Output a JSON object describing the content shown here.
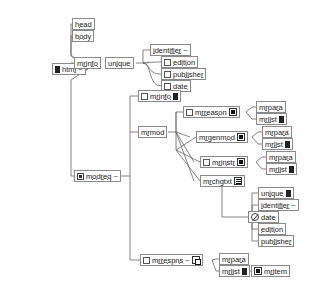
{
  "diagram": {
    "type": "content-model-tree",
    "colors": {
      "background": "#ffffff",
      "node_border": "#8a8a8a",
      "node_fill": "#ffffff",
      "wire": "#666666",
      "text": "#1a1a1a",
      "icon_fill": "#111111"
    },
    "icon_names": {
      "bar": "solid-bar-icon",
      "checkbox": "empty-checkbox-icon",
      "filled": "filled-square-icon",
      "stack": "stacked-lines-icon",
      "copy": "duplicate-box-icon",
      "mod": "module-icon",
      "ban": "circle-slash-icon"
    },
    "nodes": [
      {
        "id": "html",
        "label": "html",
        "tilde": "~",
        "left_icon": "bar",
        "right_icon": null,
        "x": 52,
        "y": 63
      },
      {
        "id": "head",
        "label": "head",
        "tilde": "",
        "left_icon": null,
        "right_icon": null,
        "x": 72,
        "y": 18
      },
      {
        "id": "body",
        "label": "body",
        "tilde": "",
        "left_icon": null,
        "right_icon": null,
        "x": 72,
        "y": 30
      },
      {
        "id": "mrinfo1",
        "label": "mrinfo",
        "tilde": "",
        "left_icon": null,
        "right_icon": null,
        "x": 74,
        "y": 57
      },
      {
        "id": "unique1",
        "label": "unique",
        "tilde": "",
        "left_icon": null,
        "right_icon": null,
        "x": 105,
        "y": 57
      },
      {
        "id": "identifier1",
        "label": "identifier",
        "tilde": "~",
        "left_icon": null,
        "right_icon": null,
        "x": 150,
        "y": 44
      },
      {
        "id": "edition1",
        "label": "edition",
        "tilde": "",
        "left_icon": "checkbox",
        "right_icon": null,
        "x": 161,
        "y": 56
      },
      {
        "id": "publisher1",
        "label": "publisher",
        "tilde": "",
        "left_icon": "checkbox",
        "right_icon": null,
        "x": 161,
        "y": 68
      },
      {
        "id": "date1",
        "label": "date",
        "tilde": "",
        "left_icon": "checkbox",
        "right_icon": null,
        "x": 161,
        "y": 80
      },
      {
        "id": "modreq",
        "label": "modreq",
        "tilde": "~",
        "left_icon": "mod",
        "right_icon": null,
        "x": 74,
        "y": 170
      },
      {
        "id": "mrinfo2",
        "label": "mrinfo",
        "tilde": "",
        "left_icon": "checkbox",
        "right_icon": "bar",
        "x": 138,
        "y": 90
      },
      {
        "id": "mrmod",
        "label": "mrmod",
        "tilde": "",
        "left_icon": null,
        "right_icon": null,
        "x": 138,
        "y": 126
      },
      {
        "id": "mrreason",
        "label": "mrreason",
        "tilde": "",
        "left_icon": "checkbox",
        "right_icon": "filled",
        "x": 183,
        "y": 106
      },
      {
        "id": "mrgenmod",
        "label": "mrgenmod",
        "tilde": "",
        "left_icon": null,
        "right_icon": "filled",
        "x": 196,
        "y": 131
      },
      {
        "id": "mrinstr",
        "label": "mrinstr",
        "tilde": "",
        "left_icon": "checkbox",
        "right_icon": "filled",
        "x": 200,
        "y": 156
      },
      {
        "id": "mrchgtxt",
        "label": "mrchgtxt",
        "tilde": "",
        "left_icon": null,
        "right_icon": "stack",
        "x": 200,
        "y": 175
      },
      {
        "id": "mrpara1",
        "label": "mrpara",
        "tilde": "",
        "left_icon": null,
        "right_icon": null,
        "x": 256,
        "y": 101
      },
      {
        "id": "mrlist1",
        "label": "mrlist",
        "tilde": "",
        "left_icon": null,
        "right_icon": "bar",
        "x": 256,
        "y": 113
      },
      {
        "id": "mrpara2",
        "label": "mrpara",
        "tilde": "",
        "left_icon": null,
        "right_icon": null,
        "x": 262,
        "y": 126
      },
      {
        "id": "mrlist2",
        "label": "mrlist",
        "tilde": "",
        "left_icon": null,
        "right_icon": "bar",
        "x": 262,
        "y": 138
      },
      {
        "id": "mrpara3",
        "label": "mrpara",
        "tilde": "",
        "left_icon": null,
        "right_icon": null,
        "x": 266,
        "y": 151
      },
      {
        "id": "mrlist3",
        "label": "mrlist",
        "tilde": "",
        "left_icon": null,
        "right_icon": "bar",
        "x": 266,
        "y": 163
      },
      {
        "id": "unique2",
        "label": "unique",
        "tilde": "",
        "left_icon": null,
        "right_icon": "bar",
        "x": 258,
        "y": 187
      },
      {
        "id": "identifier2",
        "label": "identifier",
        "tilde": "~",
        "left_icon": null,
        "right_icon": null,
        "x": 258,
        "y": 199
      },
      {
        "id": "date2",
        "label": "date",
        "tilde": "",
        "left_icon": "ban",
        "right_icon": null,
        "x": 248,
        "y": 211
      },
      {
        "id": "edition2",
        "label": "edition",
        "tilde": "",
        "left_icon": null,
        "right_icon": null,
        "x": 258,
        "y": 223
      },
      {
        "id": "publisher2",
        "label": "publisher",
        "tilde": "",
        "left_icon": null,
        "right_icon": null,
        "x": 258,
        "y": 235
      },
      {
        "id": "mrrespns",
        "label": "mrrespns",
        "tilde": "~",
        "left_icon": "checkbox",
        "right_icon": "copy",
        "x": 140,
        "y": 254
      },
      {
        "id": "mrpara4",
        "label": "mrpara",
        "tilde": "",
        "left_icon": null,
        "right_icon": null,
        "x": 219,
        "y": 253
      },
      {
        "id": "mrlist4",
        "label": "mrlist",
        "tilde": "",
        "left_icon": null,
        "right_icon": "bar",
        "x": 219,
        "y": 265
      },
      {
        "id": "mritem",
        "label": "mritem",
        "tilde": "",
        "left_icon": "filled",
        "right_icon": null,
        "x": 251,
        "y": 265
      }
    ],
    "edges": [
      {
        "from": "html",
        "to": "head"
      },
      {
        "from": "html",
        "to": "body"
      },
      {
        "from": "html",
        "to": "mrinfo1"
      },
      {
        "from": "html",
        "to": "modreq"
      },
      {
        "from": "unique1",
        "to": "identifier1"
      },
      {
        "from": "unique1",
        "to": "edition1"
      },
      {
        "from": "unique1",
        "to": "publisher1"
      },
      {
        "from": "unique1",
        "to": "date1"
      },
      {
        "from": "modreq",
        "to": "mrinfo2"
      },
      {
        "from": "modreq",
        "to": "mrmod"
      },
      {
        "from": "modreq",
        "to": "mrrespns"
      },
      {
        "from": "mrmod",
        "to": "mrreason"
      },
      {
        "from": "mrmod",
        "to": "mrgenmod"
      },
      {
        "from": "mrmod",
        "to": "mrinstr"
      },
      {
        "from": "mrmod",
        "to": "mrchgtxt"
      },
      {
        "from": "mrreason",
        "to": "mrpara1"
      },
      {
        "from": "mrreason",
        "to": "mrlist1"
      },
      {
        "from": "mrgenmod",
        "to": "mrpara2"
      },
      {
        "from": "mrgenmod",
        "to": "mrlist2"
      },
      {
        "from": "mrinstr",
        "to": "mrpara3"
      },
      {
        "from": "mrinstr",
        "to": "mrlist3"
      },
      {
        "from": "mrchgtxt",
        "to": "date2"
      },
      {
        "from": "date2",
        "to": "unique2"
      },
      {
        "from": "date2",
        "to": "identifier2"
      },
      {
        "from": "date2",
        "to": "edition2"
      },
      {
        "from": "date2",
        "to": "publisher2"
      },
      {
        "from": "mrrespns",
        "to": "mrpara4"
      },
      {
        "from": "mrrespns",
        "to": "mrlist4"
      },
      {
        "from": "mrlist4",
        "to": "mritem"
      }
    ]
  }
}
